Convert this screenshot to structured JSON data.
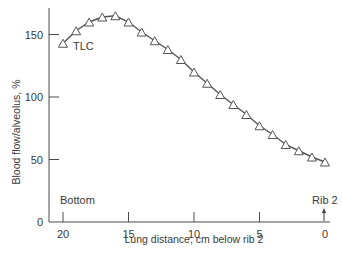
{
  "chart_data": {
    "type": "line",
    "title": "",
    "xlabel": "Lung distance, cm below rib 2",
    "ylabel": "Blood flow/alveolus, %",
    "xlim": [
      20,
      0
    ],
    "ylim": [
      0,
      170
    ],
    "x_reversed": true,
    "grid": false,
    "legend": null,
    "x_ticks": [
      20,
      15,
      10,
      5,
      0
    ],
    "y_ticks": [
      0,
      50,
      100,
      150
    ],
    "series": [
      {
        "name": "TLC",
        "marker": "open-triangle",
        "x": [
          20,
          19,
          18,
          17,
          16,
          15,
          14,
          13,
          12,
          11,
          10,
          9,
          8,
          7,
          6,
          5,
          4,
          3,
          2,
          1,
          0
        ],
        "values": [
          143,
          153,
          160,
          164,
          165,
          160,
          152,
          145,
          138,
          130,
          120,
          111,
          102,
          94,
          86,
          77,
          70,
          62,
          57,
          52,
          48
        ]
      }
    ],
    "annotations": [
      {
        "text": "TLC",
        "x": 18.4,
        "y": 139
      },
      {
        "text": "Bottom",
        "x": 20,
        "y": 18
      },
      {
        "text": "Rib 2",
        "x": 0,
        "y": 18,
        "arrow": true
      }
    ]
  },
  "labels": {
    "xlabel": "Lung distance, cm below rib 2",
    "ylabel": "Blood flow/alveolus, %",
    "tlc": "TLC",
    "bottom": "Bottom",
    "rib2": "Rib 2"
  }
}
